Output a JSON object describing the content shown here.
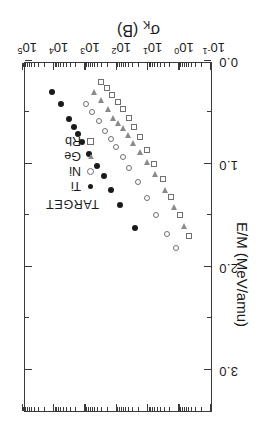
{
  "chart_data": {
    "type": "scatter",
    "title": "",
    "xlabel": "σK (B)",
    "xlabel_main": "σ",
    "xlabel_sub": "K",
    "xlabel_unit": " (B)",
    "ylabel": "E/M (MeV/amu)",
    "x_scale": "log",
    "y_scale": "linear",
    "xlim": [
      0.1,
      100000
    ],
    "ylim": [
      0.0,
      3.4
    ],
    "grid": false,
    "legend_position": "upper-left-inside",
    "x_ticks": [
      {
        "value": 0.1,
        "label": "10",
        "exp": "-1"
      },
      {
        "value": 1,
        "label": "10",
        "exp": "0"
      },
      {
        "value": 10,
        "label": "10",
        "exp": "1"
      },
      {
        "value": 100,
        "label": "10",
        "exp": "2"
      },
      {
        "value": 1000,
        "label": "10",
        "exp": "3"
      },
      {
        "value": 10000,
        "label": "10",
        "exp": "4"
      },
      {
        "value": 100000,
        "label": "10",
        "exp": "5"
      }
    ],
    "y_ticks": [
      {
        "value": 0.0,
        "label": "0.0"
      },
      {
        "value": 1.0,
        "label": "1.0"
      },
      {
        "value": 2.0,
        "label": "2.0"
      },
      {
        "value": 3.0,
        "label": "3.0"
      }
    ],
    "legend": {
      "title": "TARGET",
      "entries": [
        {
          "name": "Ti",
          "marker": "filled-circle"
        },
        {
          "name": "Ni",
          "marker": "open-circle"
        },
        {
          "name": "Ge",
          "marker": "open-triangle"
        },
        {
          "name": "Rb",
          "marker": "open-square"
        }
      ]
    },
    "series": [
      {
        "name": "Ti",
        "marker": "filled-circle",
        "points": [
          [
            12000,
            0.3
          ],
          [
            6300,
            0.42
          ],
          [
            3300,
            0.56
          ],
          [
            2400,
            0.64
          ],
          [
            1800,
            0.71
          ],
          [
            1300,
            0.79
          ],
          [
            800,
            0.9
          ],
          [
            430,
            1.02
          ],
          [
            260,
            1.12
          ],
          [
            150,
            1.25
          ],
          [
            78,
            1.4
          ],
          [
            27,
            1.62
          ]
        ]
      },
      {
        "name": "Ni",
        "marker": "open-circle",
        "points": [
          [
            980,
            0.42
          ],
          [
            620,
            0.5
          ],
          [
            380,
            0.58
          ],
          [
            240,
            0.68
          ],
          [
            160,
            0.76
          ],
          [
            105,
            0.84
          ],
          [
            66,
            0.93
          ],
          [
            40,
            1.04
          ],
          [
            22,
            1.18
          ],
          [
            11,
            1.33
          ],
          [
            5.5,
            1.5
          ],
          [
            2.6,
            1.68
          ],
          [
            1.3,
            1.82
          ]
        ]
      },
      {
        "name": "Ge",
        "marker": "open-triangle",
        "points": [
          [
            530,
            0.3
          ],
          [
            330,
            0.38
          ],
          [
            200,
            0.47
          ],
          [
            130,
            0.55
          ],
          [
            92,
            0.6
          ],
          [
            66,
            0.65
          ],
          [
            46,
            0.72
          ],
          [
            30,
            0.8
          ],
          [
            19,
            0.88
          ],
          [
            11,
            0.98
          ],
          [
            6,
            1.1
          ],
          [
            3,
            1.25
          ],
          [
            1.5,
            1.42
          ],
          [
            0.75,
            1.6
          ]
        ]
      },
      {
        "name": "Rb",
        "marker": "open-square",
        "points": [
          [
            330,
            0.2
          ],
          [
            215,
            0.26
          ],
          [
            140,
            0.33
          ],
          [
            95,
            0.4
          ],
          [
            64,
            0.47
          ],
          [
            42,
            0.55
          ],
          [
            28,
            0.64
          ],
          [
            18,
            0.74
          ],
          [
            11,
            0.86
          ],
          [
            6.4,
            1.0
          ],
          [
            3.5,
            1.15
          ],
          [
            1.9,
            1.32
          ],
          [
            1.0,
            1.5
          ],
          [
            0.52,
            1.7
          ]
        ]
      }
    ]
  }
}
